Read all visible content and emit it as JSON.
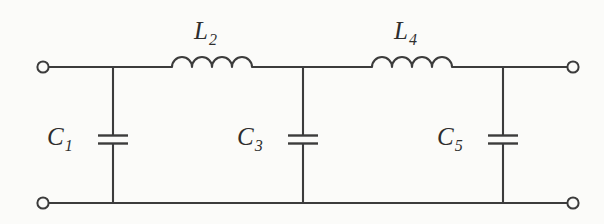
{
  "diagram": {
    "background_color": "#fbfbf9",
    "line_color": "#3c3c3c",
    "components": [
      {
        "id": "L2",
        "type": "inductor",
        "symbol_name": "inductor-coil",
        "label_letter": "L",
        "label_subscript": "2",
        "label_text": "L2",
        "orientation": "horizontal",
        "placement": "series-top-rail",
        "coil_humps": 4
      },
      {
        "id": "L4",
        "type": "inductor",
        "symbol_name": "inductor-coil",
        "label_letter": "L",
        "label_subscript": "4",
        "label_text": "L4",
        "orientation": "horizontal",
        "placement": "series-top-rail",
        "coil_humps": 4
      },
      {
        "id": "C1",
        "type": "capacitor",
        "symbol_name": "capacitor-parallel-plates",
        "label_letter": "C",
        "label_subscript": "1",
        "label_text": "C1",
        "orientation": "vertical",
        "placement": "shunt-branch"
      },
      {
        "id": "C3",
        "type": "capacitor",
        "symbol_name": "capacitor-parallel-plates",
        "label_letter": "C",
        "label_subscript": "3",
        "label_text": "C3",
        "orientation": "vertical",
        "placement": "shunt-branch"
      },
      {
        "id": "C5",
        "type": "capacitor",
        "symbol_name": "capacitor-parallel-plates",
        "label_letter": "C",
        "label_subscript": "5",
        "label_text": "C5",
        "orientation": "vertical",
        "placement": "shunt-branch"
      }
    ],
    "terminals": [
      {
        "id": "input-top",
        "position": "top-left",
        "style": "open-circle"
      },
      {
        "id": "output-top",
        "position": "top-right",
        "style": "open-circle"
      },
      {
        "id": "input-bottom",
        "position": "bottom-left",
        "style": "open-circle"
      },
      {
        "id": "output-bottom",
        "position": "bottom-right",
        "style": "open-circle"
      }
    ],
    "rails": [
      {
        "id": "top-rail",
        "orientation": "horizontal"
      },
      {
        "id": "bottom-rail",
        "orientation": "horizontal"
      }
    ]
  }
}
